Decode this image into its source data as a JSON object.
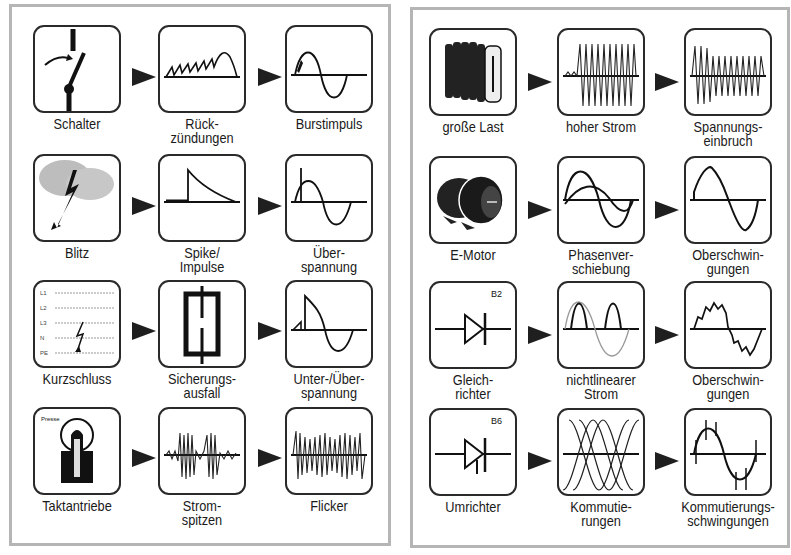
{
  "colors": {
    "panel_border": "#b5b5b5",
    "box_border": "#2a2a2a",
    "ink": "#1a1a1a",
    "arrow": "#1f1f1f"
  },
  "left_panel": {
    "rows": [
      {
        "items": [
          {
            "label": "Schalter",
            "icon": "switch-icon"
          },
          {
            "label": "Rück-\nzündungen",
            "icon": "restrike-waveform-icon"
          },
          {
            "label": "Burstimpuls",
            "icon": "burst-sine-icon"
          }
        ]
      },
      {
        "items": [
          {
            "label": "Blitz",
            "icon": "lightning-cloud-icon"
          },
          {
            "label": "Spike/\nImpulse",
            "icon": "spike-impulse-icon"
          },
          {
            "label": "Über-\nspannung",
            "icon": "overvoltage-sine-icon"
          }
        ]
      },
      {
        "items": [
          {
            "label": "Kurzschluss",
            "icon": "short-circuit-lines-icon",
            "line_labels": [
              "L1",
              "L2",
              "L3",
              "N",
              "PE"
            ]
          },
          {
            "label": "Sicherungs-\nausfall",
            "icon": "fuse-icon"
          },
          {
            "label": "Unter-/Über-\nspannung",
            "icon": "under-over-voltage-icon"
          }
        ]
      },
      {
        "items": [
          {
            "label": "Taktantriebe",
            "icon": "press-icon",
            "icon_text": "Presse"
          },
          {
            "label": "Strom-\nspitzen",
            "icon": "current-spikes-icon"
          },
          {
            "label": "Flicker",
            "icon": "flicker-waveform-icon"
          }
        ]
      }
    ]
  },
  "right_panel": {
    "rows": [
      {
        "items": [
          {
            "label": "große Last",
            "icon": "heater-radiator-icon"
          },
          {
            "label": "hoher Strom",
            "icon": "high-current-waveform-icon"
          },
          {
            "label": "Spannungs-\neinbruch",
            "icon": "voltage-dip-waveform-icon"
          }
        ]
      },
      {
        "items": [
          {
            "label": "E-Motor",
            "icon": "electric-motor-icon"
          },
          {
            "label": "Phasenver-\nschiebung",
            "icon": "phase-shift-waveform-icon"
          },
          {
            "label": "Oberschwin-\ngungen",
            "icon": "distorted-sine-icon"
          }
        ]
      },
      {
        "items": [
          {
            "label": "Gleich-\nrichter",
            "icon": "diode-icon",
            "icon_text": "B2"
          },
          {
            "label": "nichtlinearer\nStrom",
            "icon": "nonlinear-current-icon"
          },
          {
            "label": "Oberschwin-\ngungen",
            "icon": "harmonic-ripple-icon"
          }
        ]
      },
      {
        "items": [
          {
            "label": "Umrichter",
            "icon": "thyristor-icon",
            "icon_text": "B6"
          },
          {
            "label": "Kommutie-\nrungen",
            "icon": "commutation-waves-icon"
          },
          {
            "label": "Kommutierungs-\nschwingungen",
            "icon": "commutation-notches-icon"
          }
        ]
      }
    ]
  }
}
